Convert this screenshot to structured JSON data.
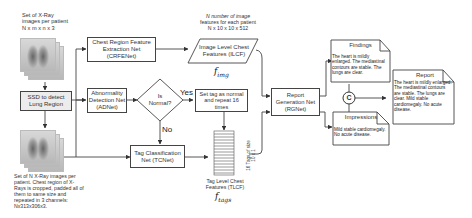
{
  "diagram": {
    "input_caption": [
      "Set of  X-Ray",
      "images per patient",
      "N x m x n x 3"
    ],
    "cropped_caption": [
      "Set of N X-Ray images per",
      "patient. Chest region of X-",
      "Rays is cropped, padded all of",
      "them to same size and",
      "repeated in 3 channels:",
      "Nx313x306x3."
    ],
    "ssd_box": [
      "SSD to detect",
      "Lung Region"
    ],
    "crfenet_box": [
      "Chest Region Feature",
      "Extraction Net",
      "(CRFENet)"
    ],
    "adnet_box": [
      "Abnormality",
      "Detection Net",
      "(ADNet)"
    ],
    "decision": [
      "Is",
      "Normal?"
    ],
    "yes_label": "Yes",
    "no_label": "No",
    "set_tag_box": [
      "Set tag as normal",
      "and repeat 16",
      "times"
    ],
    "tcnet_box": [
      "Tag Classification",
      "Net (TCNet)"
    ],
    "ilcf_caption": [
      "N number of image",
      "features for each patient",
      "N x 10 x 10 x 512"
    ],
    "ilcf_box": [
      "Image Level Chest",
      "Features (ILCF)"
    ],
    "f_img": "f",
    "f_img_sub": "img",
    "tlcf_side": [
      "16 Tags of size",
      "10 x 1"
    ],
    "tlcf_caption": [
      "Tag Level Chest",
      "Features (TLCF)"
    ],
    "f_tags": "f",
    "f_tags_sub": "tags",
    "rgnet_box": [
      "Report",
      "Generation Net",
      "(RGNet)"
    ],
    "findings": {
      "title": "Findings",
      "text": "The heart is mildly enlarged. The mediastinal contours are stable. The lungs are clear."
    },
    "impressions": {
      "title": "Impressions",
      "text": "Mild stable cardiomegaly. No acute disease."
    },
    "concat_symbol": "C",
    "report": {
      "title": "Report",
      "text": "The heart is mildly enlarged. The mediastinal contours are stable. The lungs are clear. Mild stable cardiomegaly. No acute disease."
    }
  }
}
